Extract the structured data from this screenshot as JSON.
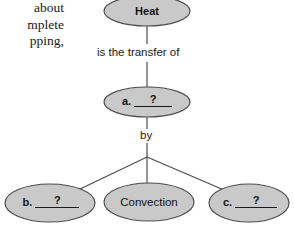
{
  "page": {
    "width": 294,
    "height": 227,
    "background": "#ffffff"
  },
  "body_text": {
    "lines": [
      "about",
      "mplete",
      "pping,"
    ]
  },
  "diagram": {
    "style": {
      "node_fill": "#c9c9c9",
      "node_stroke": "#4d4d4d",
      "edge_stroke": "#4d4d4d",
      "text_color": "#111111"
    },
    "nodes": [
      {
        "id": "heat",
        "name": "heat-node",
        "label": "Heat",
        "kind": "filled",
        "cx": 147,
        "cy": 11,
        "rx": 43,
        "ry": 15
      },
      {
        "id": "answer-a",
        "name": "answer-a-node",
        "letter": "a.",
        "label": "?",
        "kind": "blank",
        "cx": 147,
        "cy": 102,
        "rx": 43,
        "ry": 15
      },
      {
        "id": "answer-b",
        "name": "answer-b-node",
        "letter": "b.",
        "label": "?",
        "kind": "blank",
        "cx": 50,
        "cy": 203,
        "rx": 45,
        "ry": 19
      },
      {
        "id": "convection",
        "name": "convection-node",
        "label": "Convection",
        "kind": "filled",
        "cx": 149,
        "cy": 202,
        "rx": 45,
        "ry": 19
      },
      {
        "id": "answer-c",
        "name": "answer-c-node",
        "letter": "c.",
        "label": "?",
        "kind": "blank",
        "cx": 249,
        "cy": 203,
        "rx": 40,
        "ry": 19
      }
    ],
    "edges": [
      {
        "id": "heat-to-a",
        "name": "edge-heat-to-answer-a",
        "label": "is the transfer of",
        "label_x": 97,
        "label_y": 47
      },
      {
        "id": "a-to-branch",
        "name": "edge-answer-a-to-branch",
        "label": "by",
        "label_x": 140,
        "label_y": 130
      },
      {
        "id": "branch-to-b",
        "name": "edge-branch-to-answer-b",
        "label": ""
      },
      {
        "id": "branch-to-convection",
        "name": "edge-branch-to-convection",
        "label": ""
      },
      {
        "id": "branch-to-c",
        "name": "edge-branch-to-answer-c",
        "label": ""
      }
    ]
  }
}
